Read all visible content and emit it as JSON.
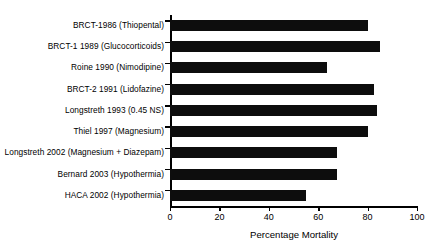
{
  "chart": {
    "type": "bar",
    "orientation": "horizontal",
    "title": "",
    "xlabel": "Percentage Mortality",
    "ylabel": "",
    "xlim": [
      0,
      100
    ],
    "xticks": [
      0,
      20,
      40,
      60,
      80,
      100
    ],
    "grid": false,
    "legend": false,
    "bar_color": "#0d0d0d",
    "background": "#ffffff"
  },
  "chart_data": {
    "type": "bar",
    "title": "",
    "xlabel": "Percentage Mortality",
    "ylabel": "",
    "xlim": [
      0,
      100
    ],
    "xticks": [
      0,
      20,
      40,
      60,
      80,
      100
    ],
    "grid": false,
    "legend": false,
    "orientation": "horizontal",
    "categories": [
      "BRCT-1986 (Thiopental)",
      "BRCT-1 1989 (Glucocorticoids)",
      "Roine 1990 (Nimodipine)",
      "BRCT-2 1991 (Lidofazine)",
      "Longstreth 1993 (0.45 NS)",
      "Thiel 1997 (Magnesium)",
      "Longstreth 2002 (Magnesium + Diazepam)",
      "Bernard 2003 (Hypothermia)",
      "HACA 2002 (Hypothermia)"
    ],
    "values": [
      80,
      85,
      63.5,
      82.5,
      84,
      80,
      67.5,
      67.5,
      55
    ]
  },
  "axis": {
    "tick_labels": [
      "0",
      "20",
      "40",
      "60",
      "80",
      "100"
    ]
  }
}
